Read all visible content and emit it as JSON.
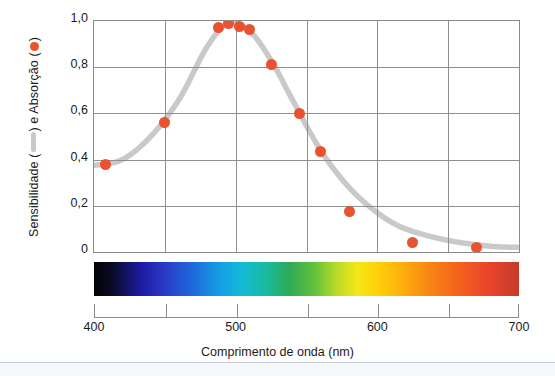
{
  "chart_data": {
    "type": "scatter",
    "title": "",
    "xlabel": "Comprimento de onda (nm)",
    "ylabel": "Sensibilidade (—) e Absorção (●)",
    "ylabel_parts": {
      "prefix": "Sensibilidade (",
      "middle": ") e Absorção (",
      "suffix": ")"
    },
    "xlim": [
      400,
      700
    ],
    "ylim": [
      0,
      1.0
    ],
    "grid": true,
    "legend_position": "y-axis-title",
    "xticks": [
      400,
      450,
      500,
      550,
      600,
      650,
      700
    ],
    "xticklabels": [
      "400",
      "",
      "500",
      "",
      "600",
      "",
      "700"
    ],
    "yticks": [
      0,
      0.2,
      0.4,
      0.6,
      0.8,
      1.0
    ],
    "yticklabels": [
      "0",
      "0,2",
      "0,4",
      "0,6",
      "0,8",
      "1,0"
    ],
    "series": [
      {
        "name": "Absorção",
        "type": "scatter",
        "marker": "circle",
        "color": "#e8522f",
        "x": [
          408,
          450,
          488,
          495,
          503,
          510,
          525,
          545,
          560,
          580,
          625,
          670
        ],
        "y": [
          0.38,
          0.56,
          0.97,
          0.99,
          0.975,
          0.965,
          0.81,
          0.6,
          0.435,
          0.175,
          0.04,
          0.02
        ]
      },
      {
        "name": "Sensibilidade",
        "type": "line",
        "color": "#c9c9c9",
        "x": [
          400,
          420,
          440,
          460,
          480,
          495,
          510,
          525,
          540,
          560,
          580,
          600,
          620,
          650,
          680,
          700
        ],
        "y": [
          0.375,
          0.4,
          0.5,
          0.66,
          0.89,
          0.99,
          0.955,
          0.83,
          0.66,
          0.44,
          0.28,
          0.17,
          0.1,
          0.05,
          0.025,
          0.02
        ]
      }
    ],
    "spectrum_bar": {
      "name": "visible-light-spectrum",
      "range_nm": [
        400,
        700
      ],
      "colors": [
        "#030306",
        "#1c1ba0",
        "#2060d8",
        "#14a0e4",
        "#2eaa55",
        "#b9da2a",
        "#f3e717",
        "#fdb20c",
        "#f4601d",
        "#c53a2c"
      ]
    },
    "colors": {
      "marker": "#e8522f",
      "line": "#c9c9c9",
      "grid": "#8f8f8f",
      "axis": "#8c8c8c",
      "text": "#1b1b1b"
    }
  }
}
